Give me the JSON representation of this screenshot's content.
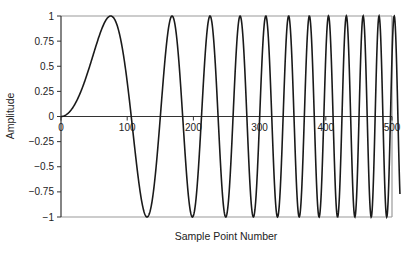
{
  "chart_data": {
    "type": "line",
    "title": "",
    "xlabel": "Sample Point Number",
    "ylabel": "Amplitude",
    "xlim": [
      0,
      512
    ],
    "ylim": [
      -1,
      1
    ],
    "x_ticks": [
      0,
      100,
      200,
      300,
      400,
      500
    ],
    "x_tick_labels": [
      "0",
      "100",
      "200",
      "300",
      "400",
      "500"
    ],
    "y_ticks": [
      1,
      0.75,
      0.5,
      0.25,
      0,
      -0.25,
      -0.5,
      -0.75,
      -1
    ],
    "y_tick_labels": [
      "1",
      "0.75",
      "0.5",
      "0.25",
      "0",
      "−0.25",
      "−0.5",
      "−0.75",
      "−1"
    ],
    "grid": false,
    "legend": null,
    "series": [
      {
        "name": "chirp signal",
        "description": "Linear chirp: amplitude = sin(k * n^2), frequency increasing with sample number",
        "k": 0.000279,
        "n_points": 512,
        "sample_points": [
          {
            "x": 0,
            "y": 0
          },
          {
            "x": 75,
            "y": 1
          },
          {
            "x": 130,
            "y": -1
          },
          {
            "x": 168,
            "y": 1
          },
          {
            "x": 198,
            "y": -1
          },
          {
            "x": 225,
            "y": 1
          },
          {
            "x": 248,
            "y": -1
          },
          {
            "x": 270,
            "y": 1
          },
          {
            "x": 290,
            "y": -1
          },
          {
            "x": 309,
            "y": 1
          },
          {
            "x": 327,
            "y": -1
          },
          {
            "x": 344,
            "y": 1
          },
          {
            "x": 360,
            "y": -1
          },
          {
            "x": 375,
            "y": 1
          },
          {
            "x": 390,
            "y": -1
          },
          {
            "x": 405,
            "y": 1
          },
          {
            "x": 420,
            "y": -1
          },
          {
            "x": 433,
            "y": 1
          },
          {
            "x": 447,
            "y": -1
          },
          {
            "x": 460,
            "y": 1
          },
          {
            "x": 473,
            "y": -1
          },
          {
            "x": 485,
            "y": 1
          },
          {
            "x": 497,
            "y": -1
          }
        ]
      }
    ],
    "colors": {
      "line": "#1a1a1a",
      "axis": "#333333",
      "frame": "#9a9a9a"
    }
  }
}
